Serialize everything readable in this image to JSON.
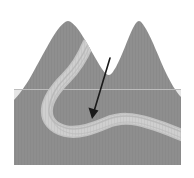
{
  "figure": {
    "title": "Block diagram of two mountain peaks with an incised meandering river",
    "type": "geological-block-diagram",
    "canvas": {
      "width": 194,
      "height": 178
    },
    "background_color": "#ffffff"
  },
  "colors": {
    "terrain_fill": "#8f8f8f",
    "terrain_fill_shadow": "#888888",
    "river_fill": "#cfcfcf",
    "river_edge": "#bdbdbd",
    "river_texture": "#b4b4b4",
    "surface_line": "#b8b8b8",
    "arrow_color": "#1a1a1a",
    "background": "#ffffff"
  },
  "block": {
    "name": "terrain-block",
    "left_x": 14,
    "right_x": 181,
    "top_surface_y": 89,
    "bottom_y": 165,
    "description": "Solid gray rock block forming the cross-section body"
  },
  "peaks": [
    {
      "name": "left-peak",
      "apex_x": 68,
      "apex_y": 22,
      "base_left_x": 14,
      "base_right_x": 108,
      "label": "Left peak"
    },
    {
      "name": "right-peak",
      "apex_x": 137,
      "apex_y": 22,
      "base_left_x": 110,
      "base_right_x": 181,
      "label": "Right peak"
    }
  ],
  "valley": {
    "name": "saddle-valley",
    "saddle_x": 108,
    "saddle_y": 72,
    "label": "Saddle between peaks"
  },
  "river": {
    "name": "meandering-river",
    "label": "Meandering river channel",
    "width_px": 9,
    "path_points": [
      [
        88,
        46
      ],
      [
        80,
        62
      ],
      [
        66,
        78
      ],
      [
        54,
        92
      ],
      [
        48,
        108
      ],
      [
        52,
        122
      ],
      [
        64,
        130
      ],
      [
        80,
        131
      ],
      [
        95,
        126
      ],
      [
        112,
        120
      ],
      [
        130,
        120
      ],
      [
        150,
        125
      ],
      [
        168,
        131
      ],
      [
        181,
        134
      ]
    ],
    "description": "Light gray channel descending from the saddle, looping in a tight meander bend, then flowing right"
  },
  "arrow": {
    "name": "annotation-arrow",
    "label": "Pointer to meander bend",
    "start_x": 110,
    "start_y": 58,
    "end_x": 92,
    "end_y": 118,
    "head_length": 11,
    "head_width": 7,
    "stroke_width": 1.6
  }
}
